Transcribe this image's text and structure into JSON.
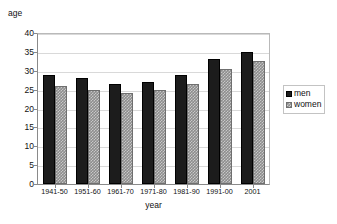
{
  "chart_data": {
    "type": "bar",
    "title": "",
    "xlabel": "year",
    "ylabel": "age",
    "categories": [
      "1941-50",
      "1951-60",
      "1961-70",
      "1971-80",
      "1981-90",
      "1991-00",
      "2001"
    ],
    "series": [
      {
        "name": "men",
        "color": "#1c1c1c",
        "values": [
          29,
          28,
          26.5,
          27,
          29,
          33,
          35
        ]
      },
      {
        "name": "women",
        "color": "#8d8d8d",
        "values": [
          26,
          25,
          24,
          25,
          26.5,
          30.5,
          32.5
        ]
      }
    ],
    "ylim": [
      0,
      40
    ],
    "ytick_labels": [
      "0",
      "5",
      "10",
      "15",
      "20",
      "25",
      "30",
      "35",
      "40"
    ],
    "ytick_values": [
      0,
      5,
      10,
      15,
      20,
      25,
      30,
      35,
      40
    ],
    "grid": true,
    "legend_position": "right",
    "legend_entries": [
      "men",
      "women"
    ]
  }
}
